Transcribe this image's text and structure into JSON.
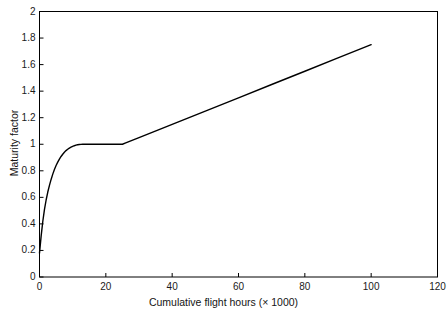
{
  "chart_data": {
    "type": "line",
    "title": "",
    "xlabel": "Cumulative flight hours (× 1000)",
    "ylabel": "Maturity factor",
    "xlim": [
      0,
      120
    ],
    "ylim": [
      0,
      2
    ],
    "grid": false,
    "legend": null,
    "xticks": [
      "0",
      "20",
      "40",
      "60",
      "80",
      "100",
      "120"
    ],
    "xtick_values": [
      0,
      20,
      40,
      60,
      80,
      100,
      120
    ],
    "yticks": [
      "0",
      "0.2",
      "0.4",
      "0.6",
      "0.8",
      "1",
      "1.2",
      "1.4",
      "1.6",
      "1.8",
      "2"
    ],
    "ytick_values": [
      0,
      0.2,
      0.4,
      0.6,
      0.8,
      1,
      1.2,
      1.4,
      1.6,
      1.8,
      2
    ],
    "line_color": "#000000",
    "line_width": 1.4,
    "series": [
      {
        "name": "Maturity factor",
        "x": [
          0,
          0.5,
          1,
          1.5,
          2,
          2.5,
          3,
          3.5,
          4,
          4.5,
          5,
          5.5,
          6,
          6.5,
          7,
          7.5,
          8,
          8.5,
          9,
          9.5,
          10,
          10.5,
          11,
          11.5,
          12,
          12.5,
          13,
          14,
          16,
          18,
          20,
          22,
          24,
          25,
          26,
          30,
          40,
          50,
          60,
          70,
          80,
          90,
          100
        ],
        "y": [
          0.18,
          0.31,
          0.42,
          0.51,
          0.58,
          0.64,
          0.69,
          0.735,
          0.775,
          0.81,
          0.84,
          0.865,
          0.888,
          0.908,
          0.925,
          0.94,
          0.952,
          0.962,
          0.971,
          0.978,
          0.984,
          0.989,
          0.993,
          0.996,
          0.998,
          0.999,
          1.0,
          1.0,
          1.0,
          1.0,
          1.0,
          1.0,
          1.0,
          1.0,
          1.01,
          1.05,
          1.15,
          1.25,
          1.35,
          1.45,
          1.55,
          1.65,
          1.75
        ]
      }
    ],
    "annotations": [
      "steep rise from 0.18 at 0 to 1.0 near 13",
      "plateau at 1.0 between 13 and 25",
      "linear rise from 1.0 at 25 to 1.75 at 100"
    ]
  },
  "axes": {
    "frame_color": "#000000"
  }
}
